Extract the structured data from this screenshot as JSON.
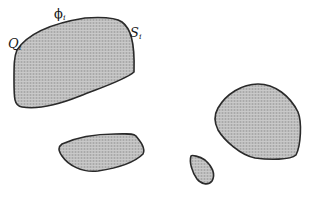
{
  "diagram": {
    "colors": {
      "fill": "#b8b8b8",
      "stroke": "#2a2a2a",
      "background": "#ffffff"
    },
    "labels": {
      "q": {
        "base": "Q",
        "sub": "i"
      },
      "phi": {
        "base": "ϕ",
        "sub": "i"
      },
      "s": {
        "base": "S",
        "sub": "i"
      }
    },
    "regions": [
      {
        "name": "large-region",
        "path": "M17,50 C30,30 60,22 85,18 C100,17 115,17 122,22 C130,28 135,40 134,72 C125,80 100,88 80,96 C60,104 40,110 22,107 C14,106 14,98 14,80 C14,65 14,57 17,50 Z"
      },
      {
        "name": "bottom-middle-region",
        "path": "M62,144 C75,138 95,134 115,134 C128,134 133,133 136,136 C140,141 146,148 143,154 C135,162 118,168 98,171 C82,173 68,165 62,156 C58,150 58,147 62,144 Z"
      },
      {
        "name": "small-teardrop-region",
        "path": "M191,156 C192,155 199,156 205,160 C212,166 216,174 212,181 C208,186 201,184 197,179 C192,172 189,162 191,156 Z"
      },
      {
        "name": "right-region",
        "path": "M218,108 C226,94 242,84 258,84 C275,84 290,96 298,112 C302,122 301,145 296,155 C290,160 270,160 255,158 C240,155 224,140 218,130 C214,122 214,115 218,108 Z"
      }
    ]
  }
}
